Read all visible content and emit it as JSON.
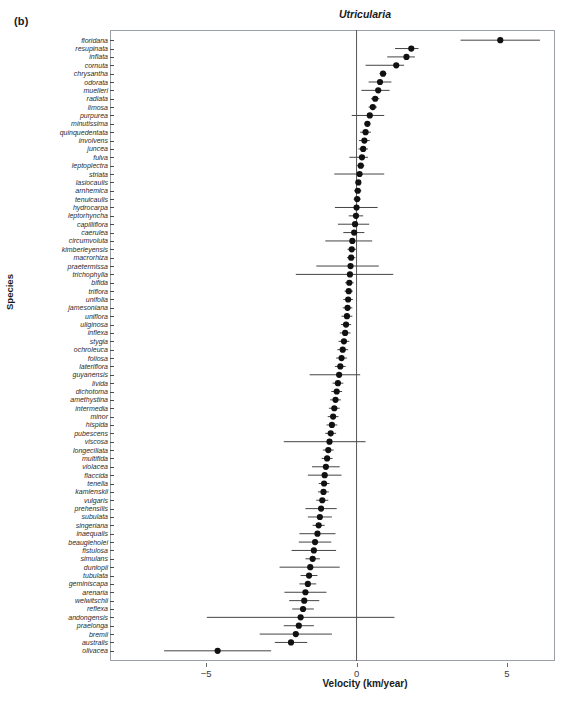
{
  "panel": {
    "letter": "(b)"
  },
  "chart_data": {
    "type": "scatter",
    "title": "Utricularia",
    "xlabel": "Velocity (km/year)",
    "ylabel": "Species",
    "xlim": [
      -8.2,
      6.6
    ],
    "xticks": [
      -5,
      0,
      5
    ],
    "xticklabels": [
      "−5",
      "0",
      "5"
    ],
    "grid": false,
    "legend": null,
    "reference_line": 0,
    "error_bar_type": "confidence-interval",
    "orientation": "horizontal",
    "categories": [
      "floridana",
      "resupinata",
      "inflata",
      "cornuta",
      "chrysantha",
      "odorata",
      "muelleri",
      "radiata",
      "limosa",
      "purpurea",
      "minutissima",
      "quinquedentata",
      "involvens",
      "juncea",
      "fulva",
      "leptoplectra",
      "striata",
      "lasiocaulis",
      "arnhemica",
      "tenuicaulis",
      "hydrocarpa",
      "leptorhyncha",
      "capilliflora",
      "caerulea",
      "circumvoluta",
      "kimberleyensis",
      "macrorhiza",
      "praetermissa",
      "trichophylla",
      "bifida",
      "triflora",
      "unifolia",
      "jamesoniana",
      "uniflora",
      "uliginosa",
      "inflexa",
      "stygia",
      "ochroleuca",
      "foliosa",
      "lateriflora",
      "guyanensis",
      "livida",
      "dichotoma",
      "amethystina",
      "intermedia",
      "minor",
      "hispida",
      "pubescens",
      "viscosa",
      "longeciliata",
      "multifida",
      "violacea",
      "flaccida",
      "tenella",
      "kamienskii",
      "vulgaris",
      "prehensilis",
      "subulata",
      "singeriana",
      "inaequalis",
      "beaugleholei",
      "fistulosa",
      "simulans",
      "dunlopii",
      "tubulata",
      "geminiscapa",
      "arenaria",
      "welwitschii",
      "reflexa",
      "andongensis",
      "praelonga",
      "bremii",
      "australis",
      "olivacea"
    ],
    "values": [
      4.78,
      1.82,
      1.66,
      1.32,
      0.88,
      0.78,
      0.72,
      0.62,
      0.54,
      0.44,
      0.36,
      0.3,
      0.26,
      0.22,
      0.18,
      0.14,
      0.1,
      0.06,
      0.04,
      0.02,
      0.0,
      -0.02,
      -0.05,
      -0.08,
      -0.14,
      -0.16,
      -0.18,
      -0.2,
      -0.22,
      -0.24,
      -0.26,
      -0.28,
      -0.3,
      -0.32,
      -0.35,
      -0.38,
      -0.42,
      -0.46,
      -0.5,
      -0.54,
      -0.58,
      -0.62,
      -0.66,
      -0.7,
      -0.74,
      -0.78,
      -0.82,
      -0.86,
      -0.9,
      -0.94,
      -0.98,
      -1.02,
      -1.06,
      -1.08,
      -1.1,
      -1.14,
      -1.18,
      -1.22,
      -1.26,
      -1.3,
      -1.38,
      -1.42,
      -1.46,
      -1.54,
      -1.58,
      -1.62,
      -1.7,
      -1.74,
      -1.78,
      -1.86,
      -1.92,
      -2.02,
      -2.18,
      -4.62
    ],
    "ci_low": [
      3.46,
      1.28,
      1.02,
      0.3,
      0.76,
      0.4,
      0.16,
      0.48,
      0.4,
      -0.16,
      0.26,
      0.12,
      0.08,
      0.06,
      -0.24,
      0.02,
      -0.74,
      -0.02,
      -0.08,
      -0.1,
      -0.72,
      -0.26,
      -0.62,
      -0.44,
      -1.04,
      -0.3,
      -0.32,
      -1.34,
      -2.02,
      -0.38,
      -0.4,
      -0.44,
      -0.46,
      -0.5,
      -0.52,
      -0.56,
      -0.6,
      -0.64,
      -0.68,
      -0.72,
      -1.56,
      -0.8,
      -0.84,
      -0.88,
      -0.92,
      -0.96,
      -1.0,
      -1.04,
      -2.42,
      -1.12,
      -1.16,
      -1.48,
      -1.62,
      -1.26,
      -1.28,
      -1.34,
      -1.7,
      -1.62,
      -1.46,
      -1.9,
      -1.92,
      -2.16,
      -1.7,
      -2.56,
      -1.86,
      -1.9,
      -2.4,
      -2.24,
      -2.14,
      -4.98,
      -2.42,
      -3.22,
      -2.72,
      -6.4
    ],
    "ci_high": [
      6.1,
      2.06,
      1.94,
      1.58,
      1.0,
      1.16,
      1.1,
      0.76,
      0.68,
      0.92,
      0.46,
      0.48,
      0.44,
      0.38,
      0.38,
      0.26,
      0.92,
      0.14,
      0.16,
      0.14,
      0.7,
      0.22,
      0.42,
      0.26,
      0.52,
      -0.02,
      -0.04,
      0.74,
      1.22,
      -0.1,
      -0.12,
      -0.12,
      -0.14,
      -0.14,
      -0.18,
      -0.2,
      -0.24,
      -0.28,
      -0.32,
      -0.36,
      0.12,
      -0.44,
      -0.48,
      -0.52,
      -0.56,
      -0.6,
      -0.64,
      -0.68,
      0.3,
      -0.76,
      -0.8,
      -0.56,
      -0.5,
      -0.9,
      -0.92,
      -0.94,
      -0.66,
      -0.82,
      -1.06,
      -0.7,
      -0.84,
      -0.68,
      -1.22,
      -0.56,
      -1.3,
      -1.34,
      -1.0,
      -1.24,
      -1.42,
      1.26,
      -1.42,
      -0.82,
      -1.64,
      -2.84
    ]
  },
  "axis": {
    "y_title": "Species",
    "x_title": "Velocity (km/year)"
  },
  "style": {
    "point_color": "#111111",
    "error_bar_color": "#444444",
    "frame_color": "#9aa0a6",
    "reference_line_color": "#555555"
  }
}
